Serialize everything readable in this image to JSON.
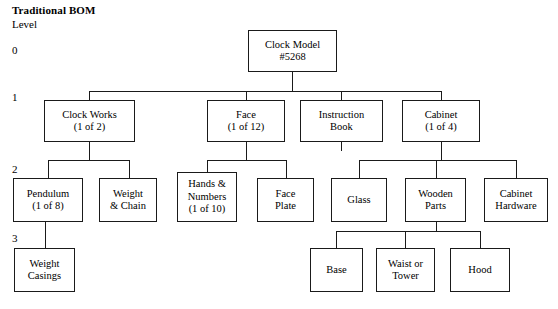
{
  "header": {
    "title": "Traditional BOM",
    "level_label": "Level"
  },
  "level_markers": [
    {
      "label": "0",
      "x": 12,
      "y": 44
    },
    {
      "label": "1",
      "x": 12,
      "y": 91
    },
    {
      "label": "2",
      "x": 12,
      "y": 163
    },
    {
      "label": "3",
      "x": 12,
      "y": 232
    }
  ],
  "diagram": {
    "type": "bill-of-materials-tree",
    "nodes": [
      {
        "id": "clock-model",
        "lines": [
          "Clock Model",
          "#5268"
        ],
        "level": 0,
        "x": 248,
        "y": 30,
        "w": 89,
        "h": 42
      },
      {
        "id": "clock-works",
        "lines": [
          "Clock Works",
          "(1 of 2)"
        ],
        "level": 1,
        "x": 44,
        "y": 100,
        "w": 91,
        "h": 42
      },
      {
        "id": "face",
        "lines": [
          "Face",
          "(1 of 12)"
        ],
        "level": 1,
        "x": 207,
        "y": 100,
        "w": 78,
        "h": 42
      },
      {
        "id": "instruction-book",
        "lines": [
          "Instruction",
          "Book"
        ],
        "level": 1,
        "x": 300,
        "y": 100,
        "w": 83,
        "h": 42
      },
      {
        "id": "cabinet",
        "lines": [
          "Cabinet",
          "(1 of 4)"
        ],
        "level": 1,
        "x": 402,
        "y": 100,
        "w": 78,
        "h": 42
      },
      {
        "id": "pendulum",
        "lines": [
          "Pendulum",
          "(1 of 8)"
        ],
        "level": 2,
        "x": 13,
        "y": 178,
        "w": 70,
        "h": 44
      },
      {
        "id": "weight-chain",
        "lines": [
          "Weight",
          "& Chain"
        ],
        "level": 2,
        "x": 99,
        "y": 178,
        "w": 58,
        "h": 44
      },
      {
        "id": "hands-numbers",
        "lines": [
          "Hands &",
          "Numbers",
          "(1 of 10)"
        ],
        "level": 2,
        "x": 177,
        "y": 172,
        "w": 60,
        "h": 50
      },
      {
        "id": "face-plate",
        "lines": [
          "Face",
          "Plate"
        ],
        "level": 2,
        "x": 257,
        "y": 178,
        "w": 57,
        "h": 44
      },
      {
        "id": "glass",
        "lines": [
          "Glass"
        ],
        "level": 2,
        "x": 331,
        "y": 178,
        "w": 56,
        "h": 44
      },
      {
        "id": "wooden-parts",
        "lines": [
          "Wooden",
          "Parts"
        ],
        "level": 2,
        "x": 405,
        "y": 178,
        "w": 61,
        "h": 44
      },
      {
        "id": "cabinet-hardware",
        "lines": [
          "Cabinet",
          "Hardware"
        ],
        "level": 2,
        "x": 484,
        "y": 178,
        "w": 64,
        "h": 44
      },
      {
        "id": "weight-casings",
        "lines": [
          "Weight",
          "Casings"
        ],
        "level": 3,
        "x": 14,
        "y": 248,
        "w": 61,
        "h": 44
      },
      {
        "id": "base",
        "lines": [
          "Base"
        ],
        "level": 3,
        "x": 310,
        "y": 248,
        "w": 53,
        "h": 44
      },
      {
        "id": "waist-or-tower",
        "lines": [
          "Waist or",
          "Tower"
        ],
        "level": 3,
        "x": 376,
        "y": 248,
        "w": 59,
        "h": 44
      },
      {
        "id": "hood",
        "lines": [
          "Hood"
        ],
        "level": 3,
        "x": 450,
        "y": 248,
        "w": 60,
        "h": 44
      }
    ],
    "connectors": [
      {
        "name": "root-stem-down",
        "orient": "v",
        "x": 292,
        "y": 72,
        "len": 19
      },
      {
        "name": "level1-bus",
        "orient": "h",
        "x": 89,
        "y": 91,
        "len": 352
      },
      {
        "name": "drop-clock-works",
        "orient": "v",
        "x": 89,
        "y": 91,
        "len": 9
      },
      {
        "name": "drop-face",
        "orient": "v",
        "x": 246,
        "y": 91,
        "len": 9
      },
      {
        "name": "drop-instruction-book",
        "orient": "v",
        "x": 341,
        "y": 91,
        "len": 9
      },
      {
        "name": "drop-cabinet",
        "orient": "v",
        "x": 441,
        "y": 91,
        "len": 9
      },
      {
        "name": "clock-works-stem",
        "orient": "v",
        "x": 89,
        "y": 142,
        "len": 18
      },
      {
        "name": "clock-works-bus",
        "orient": "h",
        "x": 48,
        "y": 160,
        "len": 82
      },
      {
        "name": "drop-pendulum",
        "orient": "v",
        "x": 48,
        "y": 160,
        "len": 18
      },
      {
        "name": "drop-weight-chain",
        "orient": "v",
        "x": 129,
        "y": 160,
        "len": 18
      },
      {
        "name": "face-stem",
        "orient": "v",
        "x": 246,
        "y": 142,
        "len": 18
      },
      {
        "name": "face-bus",
        "orient": "h",
        "x": 207,
        "y": 160,
        "len": 79
      },
      {
        "name": "drop-hands-numbers",
        "orient": "v",
        "x": 207,
        "y": 160,
        "len": 12
      },
      {
        "name": "drop-face-plate",
        "orient": "v",
        "x": 286,
        "y": 160,
        "len": 18
      },
      {
        "name": "instruction-book-stem",
        "orient": "v",
        "x": 341,
        "y": 142,
        "len": 9
      },
      {
        "name": "cabinet-stem",
        "orient": "v",
        "x": 441,
        "y": 142,
        "len": 18
      },
      {
        "name": "cabinet-bus",
        "orient": "h",
        "x": 359,
        "y": 160,
        "len": 157
      },
      {
        "name": "drop-glass",
        "orient": "v",
        "x": 359,
        "y": 160,
        "len": 18
      },
      {
        "name": "drop-wooden-parts",
        "orient": "v",
        "x": 436,
        "y": 160,
        "len": 18
      },
      {
        "name": "drop-cabinet-hardware",
        "orient": "v",
        "x": 516,
        "y": 160,
        "len": 18
      },
      {
        "name": "pendulum-stem",
        "orient": "v",
        "x": 45,
        "y": 222,
        "len": 26
      },
      {
        "name": "wooden-parts-stem",
        "orient": "v",
        "x": 436,
        "y": 222,
        "len": 9
      },
      {
        "name": "level3-bus",
        "orient": "h",
        "x": 336,
        "y": 231,
        "len": 144
      },
      {
        "name": "drop-base",
        "orient": "v",
        "x": 336,
        "y": 231,
        "len": 17
      },
      {
        "name": "drop-waist-or-tower",
        "orient": "v",
        "x": 405,
        "y": 231,
        "len": 17
      },
      {
        "name": "drop-hood",
        "orient": "v",
        "x": 480,
        "y": 231,
        "len": 17
      }
    ]
  }
}
